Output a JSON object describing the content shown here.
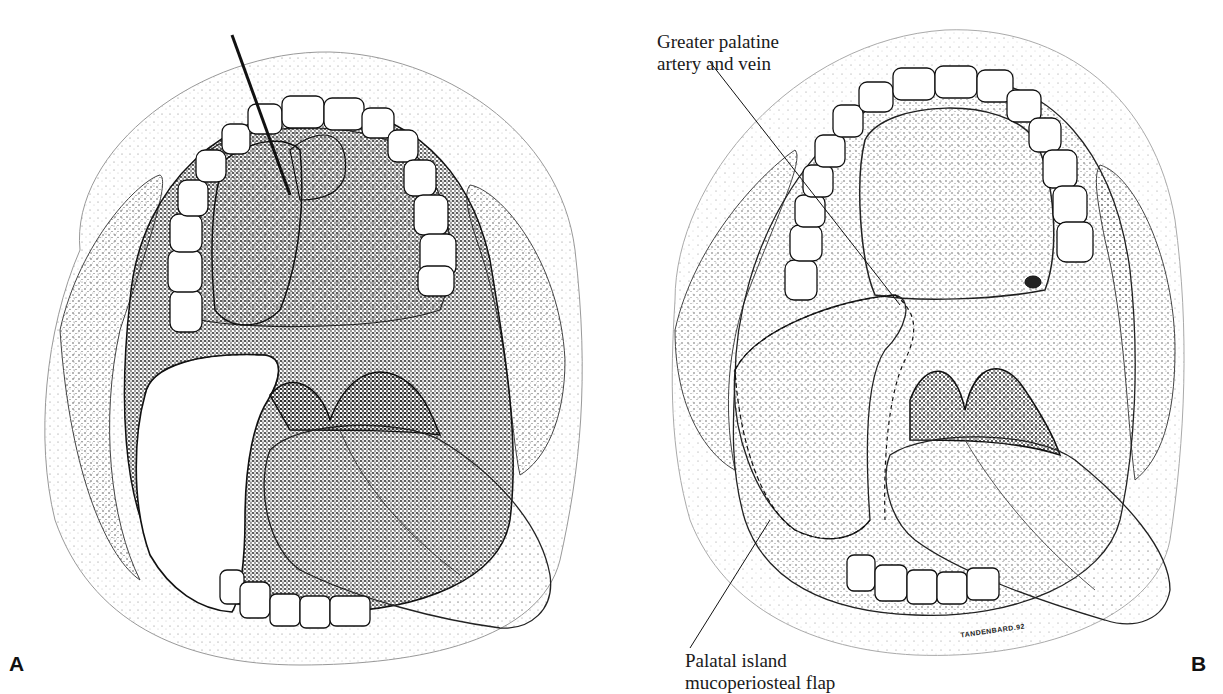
{
  "figure": {
    "panels": [
      {
        "id": "A",
        "label": "A",
        "description": "Open mouth view, palatal flap elevated with instrument, defect exposed, tongue protruding"
      },
      {
        "id": "B",
        "label": "B",
        "description": "Palatal island mucoperiosteal flap rotated into defect, sutured, tongue protruding",
        "callouts": [
          {
            "id": "gpa",
            "text_line1": "Greater palatine",
            "text_line2": "artery and vein"
          },
          {
            "id": "pim",
            "text_line1": "Palatal island",
            "text_line2": "mucoperiosteal flap"
          }
        ],
        "signature": "TANDENBARD.92"
      }
    ],
    "style": {
      "ink": "#111111",
      "paper": "#ffffff",
      "stipple": "#555555"
    }
  }
}
